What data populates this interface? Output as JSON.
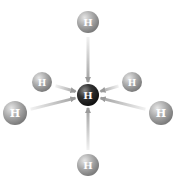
{
  "diagram": {
    "center_atom": {
      "label": "H",
      "x": 88,
      "y": 95,
      "r": 11,
      "color": "#2a2a2a"
    },
    "outer_atoms": [
      {
        "name": "top",
        "label": "H",
        "x": 88,
        "y": 22,
        "r": 11
      },
      {
        "name": "upper-left",
        "label": "H",
        "x": 42,
        "y": 82,
        "r": 10
      },
      {
        "name": "upper-right",
        "label": "H",
        "x": 132,
        "y": 82,
        "r": 10
      },
      {
        "name": "left",
        "label": "H",
        "x": 15,
        "y": 113,
        "r": 12
      },
      {
        "name": "right",
        "label": "H",
        "x": 161,
        "y": 113,
        "r": 12
      },
      {
        "name": "bottom",
        "label": "H",
        "x": 88,
        "y": 165,
        "r": 11
      }
    ],
    "outer_atom_color": "#9a9a9a",
    "arrow_color": "#b8b8b8",
    "arrow_direction": "inward"
  }
}
